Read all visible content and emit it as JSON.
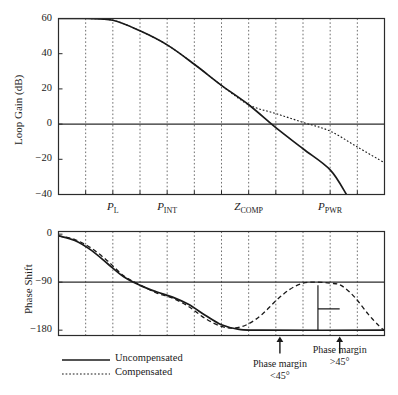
{
  "chart_data": {
    "type": "line",
    "title": "",
    "panels": [
      {
        "name": "loop-gain-panel",
        "ylabel": "Loop Gain (dB)",
        "yticks": [
          "60",
          "40",
          "20",
          "0",
          "-20",
          "-40"
        ],
        "ytick_values": [
          60,
          40,
          20,
          0,
          -20,
          -40
        ],
        "ylim": [
          -40,
          60
        ],
        "xlim": [
          0,
          12
        ],
        "grid": true,
        "xticks_labeled": [
          {
            "label": "P",
            "sub": "L",
            "x": 2
          },
          {
            "label": "P",
            "sub": "INT",
            "x": 4
          },
          {
            "label": "Z",
            "sub": "COMP",
            "x": 7
          },
          {
            "label": "P",
            "sub": "PWR",
            "x": 10
          }
        ],
        "series": [
          {
            "name": "Uncompensated",
            "style": "solid",
            "points": [
              [
                0,
                60
              ],
              [
                1,
                60
              ],
              [
                2,
                59
              ],
              [
                3,
                53
              ],
              [
                4,
                45
              ],
              [
                5,
                34
              ],
              [
                6,
                22
              ],
              [
                7,
                11
              ],
              [
                8,
                -2
              ],
              [
                9,
                -14
              ],
              [
                10,
                -26
              ],
              [
                10.6,
                -40
              ]
            ]
          },
          {
            "name": "Compensated",
            "style": "dotted",
            "points": [
              [
                0,
                60
              ],
              [
                1,
                60
              ],
              [
                2,
                59
              ],
              [
                3,
                53
              ],
              [
                4,
                45
              ],
              [
                5,
                34
              ],
              [
                6,
                22
              ],
              [
                7,
                11
              ],
              [
                8,
                6
              ],
              [
                9,
                1
              ],
              [
                10,
                -4
              ],
              [
                11,
                -13
              ],
              [
                12,
                -22
              ]
            ]
          }
        ]
      },
      {
        "name": "phase-shift-panel",
        "ylabel": "Phase Shift",
        "yticks": [
          "0",
          "-90",
          "-180"
        ],
        "ytick_values": [
          0,
          -90,
          -180
        ],
        "ylim": [
          -190,
          5
        ],
        "xlim": [
          0,
          12
        ],
        "grid": true,
        "series": [
          {
            "name": "Uncompensated",
            "style": "solid",
            "points": [
              [
                0,
                -3
              ],
              [
                0.6,
                -12
              ],
              [
                1.2,
                -30
              ],
              [
                1.8,
                -55
              ],
              [
                2.4,
                -80
              ],
              [
                3.0,
                -96
              ],
              [
                3.6,
                -108
              ],
              [
                4.2,
                -118
              ],
              [
                4.8,
                -132
              ],
              [
                5.4,
                -152
              ],
              [
                6.0,
                -170
              ],
              [
                6.6,
                -178
              ],
              [
                7.5,
                -180
              ],
              [
                12,
                -180
              ]
            ]
          },
          {
            "name": "Compensated",
            "style": "dashed",
            "points": [
              [
                0,
                -3
              ],
              [
                0.6,
                -10
              ],
              [
                1.2,
                -26
              ],
              [
                1.8,
                -50
              ],
              [
                2.4,
                -78
              ],
              [
                3.0,
                -95
              ],
              [
                3.6,
                -110
              ],
              [
                4.2,
                -120
              ],
              [
                4.8,
                -136
              ],
              [
                5.4,
                -158
              ],
              [
                6.0,
                -173
              ],
              [
                6.5,
                -176
              ],
              [
                7.0,
                -168
              ],
              [
                7.5,
                -150
              ],
              [
                8.0,
                -125
              ],
              [
                8.5,
                -104
              ],
              [
                9.0,
                -92
              ],
              [
                9.5,
                -90
              ],
              [
                10.0,
                -92
              ],
              [
                10.4,
                -96
              ],
              [
                10.9,
                -118
              ],
              [
                11.4,
                -150
              ],
              [
                11.8,
                -172
              ],
              [
                12,
                -180
              ]
            ]
          }
        ],
        "margin_markers": [
          {
            "name": "phase-margin-low",
            "x": 8.15,
            "label_line1": "Phase margin",
            "label_line2": "<45°"
          },
          {
            "name": "phase-margin-high",
            "x": 10.35,
            "label_line1": "Phase margin",
            "label_line2": ">45°"
          }
        ]
      }
    ],
    "legend": {
      "position": "bottom-left",
      "entries": [
        {
          "label": "Uncompensated",
          "style": "solid"
        },
        {
          "label": "Compensated",
          "style": "dotted"
        }
      ]
    },
    "colors": {
      "curve": "#1a1a1a",
      "axis": "#2b2b2b",
      "grid": "#6f6f6f",
      "background": "#ffffff"
    }
  }
}
